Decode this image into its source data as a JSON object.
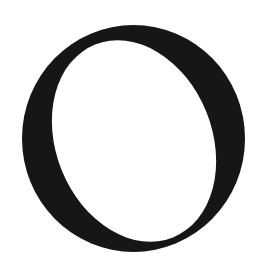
{
  "glyph": {
    "character": "O",
    "ink_color": "#141414",
    "background_color": "#ffffff",
    "outer": {
      "cx": 133.5,
      "cy": 138.5,
      "rx": 111.5,
      "ry": 113.5,
      "rotate": 0
    },
    "inner": {
      "cx": 134,
      "cy": 141,
      "rx": 78,
      "ry": 104,
      "rotate": -22
    }
  }
}
